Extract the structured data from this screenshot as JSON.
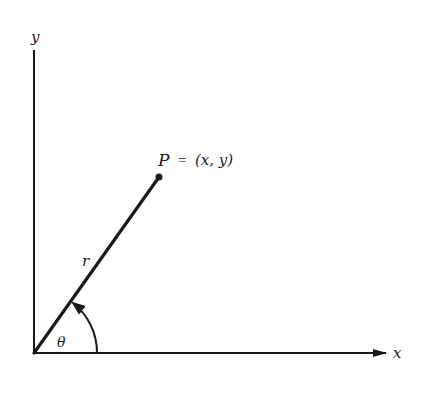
{
  "diagram": {
    "type": "polar-coordinates",
    "axes": {
      "x_label": "x",
      "y_label": "y"
    },
    "point": {
      "name": "P",
      "equals": "=",
      "coords": "(x, y)"
    },
    "radius_label": "r",
    "angle_label": "θ",
    "colors": {
      "ink": "#1a1a1a",
      "background": "#ffffff"
    }
  }
}
